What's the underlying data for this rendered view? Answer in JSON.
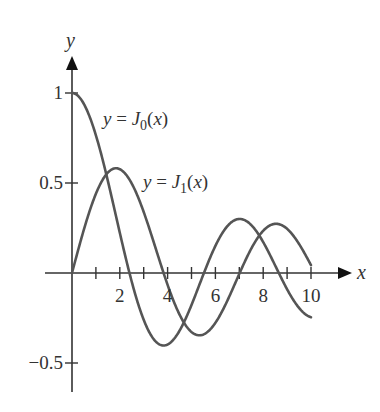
{
  "chart_data": {
    "type": "line",
    "title": "",
    "xlabel": "x",
    "ylabel": "y",
    "xlim": [
      0,
      10
    ],
    "ylim": [
      -0.5,
      1
    ],
    "x_ticks": [
      1,
      2,
      3,
      4,
      5,
      6,
      7,
      8,
      9,
      10
    ],
    "x_tick_labels": [
      "2",
      "4",
      "6",
      "8",
      "10"
    ],
    "x_tick_label_values": [
      2,
      4,
      6,
      8,
      10
    ],
    "y_ticks": [
      1,
      0.5,
      -0.5
    ],
    "y_tick_labels": [
      "1",
      "0.5",
      "−0.5"
    ],
    "grid": false,
    "legend": "inline annotations",
    "series": [
      {
        "name": "y = J0(x)",
        "label_prefix": "y = J",
        "label_sub": "0",
        "label_suffix": "(x)",
        "function": "J0",
        "x": [
          0,
          1,
          2,
          2.405,
          3,
          3.832,
          4,
          5,
          5.52,
          6,
          7,
          7.016,
          8,
          8.654,
          9,
          10
        ],
        "values": [
          1.0,
          0.765,
          0.224,
          0.0,
          -0.26,
          -0.403,
          -0.397,
          -0.178,
          0.0,
          0.151,
          0.3,
          0.3,
          0.172,
          0.0,
          -0.09,
          -0.246
        ]
      },
      {
        "name": "y = J1(x)",
        "label_prefix": "y = J",
        "label_sub": "1",
        "label_suffix": "(x)",
        "function": "J1",
        "x": [
          0,
          1,
          1.841,
          2,
          3,
          3.832,
          4,
          5,
          5.331,
          6,
          7,
          7.016,
          8,
          8.536,
          9,
          10
        ],
        "values": [
          0.0,
          0.44,
          0.582,
          0.577,
          0.339,
          0.0,
          -0.066,
          -0.328,
          -0.346,
          -0.277,
          -0.005,
          0.0,
          0.235,
          0.273,
          0.245,
          0.043
        ]
      }
    ]
  },
  "colors": {
    "curve": "#555555",
    "axis": "#333333",
    "text": "#333333"
  }
}
